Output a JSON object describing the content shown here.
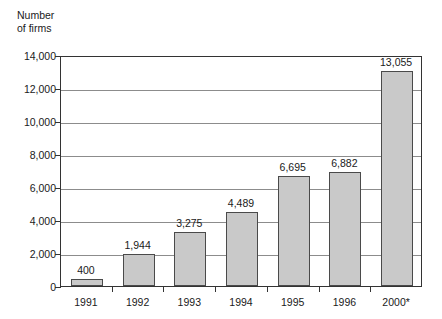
{
  "chart_data": {
    "type": "bar",
    "title": "",
    "xlabel": "",
    "ylabel": "Number\nof firms",
    "categories": [
      "1991",
      "1992",
      "1993",
      "1994",
      "1995",
      "1996",
      "2000*"
    ],
    "values": [
      400,
      1944,
      3275,
      4489,
      6695,
      6882,
      13055
    ],
    "value_labels": [
      "400",
      "1,944",
      "3,275",
      "4,489",
      "6,695",
      "6,882",
      "13,055"
    ],
    "ylim": [
      0,
      14000
    ],
    "ytick_values": [
      0,
      2000,
      4000,
      6000,
      8000,
      10000,
      12000,
      14000
    ],
    "ytick_labels": [
      "0",
      "2,000",
      "4,000",
      "6,000",
      "8,000",
      "10,000",
      "12,000",
      "14,000"
    ],
    "grid": true,
    "grid_axis": "y",
    "legend": false,
    "bar_fill_color": "#c9c9c9",
    "bar_border_color": "#4a4a4a",
    "gridline_color": "#8c8c8c",
    "axis_color": "#333333",
    "background_color": "#ffffff"
  }
}
